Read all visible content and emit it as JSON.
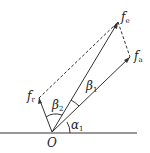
{
  "diagram": {
    "origin_label": "O",
    "vectors": [
      {
        "name": "f",
        "sub": "e"
      },
      {
        "name": "f",
        "sub": "a"
      },
      {
        "name": "f",
        "sub": "r"
      }
    ],
    "angles": [
      {
        "name": "β",
        "sub": "1"
      },
      {
        "name": "β",
        "sub": "2"
      },
      {
        "name": "α",
        "sub": "1"
      }
    ]
  }
}
